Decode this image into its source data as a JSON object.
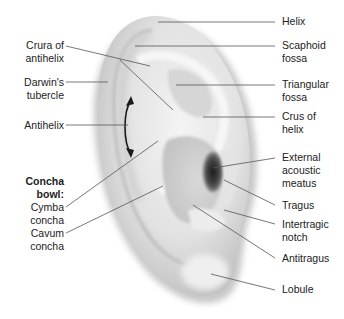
{
  "figure": {
    "colors": {
      "background": "#ffffff",
      "skin_light": "#f2f2f2",
      "skin_mid": "#d6d6d6",
      "skin_dark": "#9a9a9a",
      "meatus": "#2a2a2a",
      "leader": "#555555",
      "text": "#222222"
    },
    "labels_left": [
      {
        "id": "crura-of-antihelix",
        "line1": "Crura of",
        "line2": "antihelix"
      },
      {
        "id": "darwins-tubercle",
        "line1": "Darwin's",
        "line2": "tubercle"
      },
      {
        "id": "antihelix",
        "line1": "Antihelix",
        "line2": ""
      },
      {
        "id": "concha-bowl-heading",
        "line1": "Concha",
        "line2": "bowl:"
      },
      {
        "id": "cymba-concha",
        "line1": "Cymba",
        "line2": "concha"
      },
      {
        "id": "cavum-concha",
        "line1": "Cavum",
        "line2": "concha"
      }
    ],
    "labels_right": [
      {
        "id": "helix",
        "line1": "Helix",
        "line2": ""
      },
      {
        "id": "scaphoid-fossa",
        "line1": "Scaphoid",
        "line2": "fossa"
      },
      {
        "id": "triangular-fossa",
        "line1": "Triangular",
        "line2": "fossa"
      },
      {
        "id": "crus-of-helix",
        "line1": "Crus of",
        "line2": "helix"
      },
      {
        "id": "external-acoustic-meatus",
        "line1": "External",
        "line2": "acoustic",
        "line3": "meatus"
      },
      {
        "id": "tragus",
        "line1": "Tragus",
        "line2": ""
      },
      {
        "id": "intertragic-notch",
        "line1": "Intertragic",
        "line2": "notch"
      },
      {
        "id": "antitragus",
        "line1": "Antitragus",
        "line2": ""
      },
      {
        "id": "lobule",
        "line1": "Lobule",
        "line2": ""
      }
    ]
  }
}
